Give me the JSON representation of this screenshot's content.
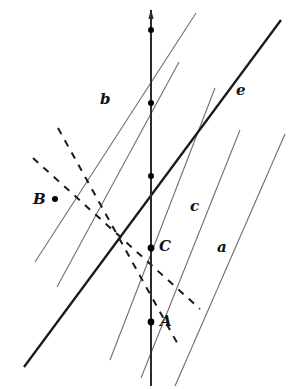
{
  "figure": {
    "width": 295,
    "height": 389,
    "background": "#ffffff"
  },
  "colors": {
    "thin_line": "#6e6e76",
    "thick_line": "#1a1a1a",
    "vertical_line": "#2b2b2b",
    "dashed_line": "#1a1a1a",
    "point_fill": "#000000",
    "label_text": "#111111"
  },
  "labels": {
    "line_a": "a",
    "line_b": "b",
    "line_c": "c",
    "line_e": "e",
    "point_A": "A",
    "point_B": "B",
    "point_C": "C"
  },
  "label_positions": {
    "line_a": {
      "x": 217,
      "y": 240
    },
    "line_b": {
      "x": 100,
      "y": 92
    },
    "line_c": {
      "x": 190,
      "y": 199
    },
    "line_e": {
      "x": 236,
      "y": 83
    },
    "point_A": {
      "x": 160,
      "y": 314
    },
    "point_B": {
      "x": 33,
      "y": 192
    },
    "point_C": {
      "x": 159,
      "y": 239
    }
  },
  "geometry": {
    "vertical_line": {
      "name": "vertical-transversal",
      "x1": 151,
      "y1": 10,
      "x2": 151,
      "y2": 386,
      "stroke": "#2b2b2b",
      "width": 2.0,
      "arrow_top": true
    },
    "thin_parallels": [
      {
        "name": "parallel-line-1",
        "x1": 35,
        "y1": 262,
        "x2": 196,
        "y2": 13,
        "stroke": "#6e6e76",
        "width": 1.1
      },
      {
        "name": "parallel-line-b",
        "x1": 57,
        "y1": 287,
        "x2": 179,
        "y2": 62,
        "stroke": "#6e6e76",
        "width": 1.1
      },
      {
        "name": "parallel-line-3",
        "x1": 110,
        "y1": 360,
        "x2": 215,
        "y2": 88,
        "stroke": "#6e6e76",
        "width": 1.1
      },
      {
        "name": "parallel-line-c",
        "x1": 141,
        "y1": 378,
        "x2": 240,
        "y2": 130,
        "stroke": "#6e6e76",
        "width": 1.1
      },
      {
        "name": "parallel-line-a",
        "x1": 175,
        "y1": 386,
        "x2": 285,
        "y2": 134,
        "stroke": "#6e6e76",
        "width": 1.1
      }
    ],
    "thick_line_e": {
      "name": "line-e",
      "x1": 24,
      "y1": 367,
      "x2": 281,
      "y2": 20,
      "stroke": "#1a1a1a",
      "width": 2.3
    },
    "dashed_lines": [
      {
        "name": "dashed-line-1",
        "x1": 33,
        "y1": 158,
        "x2": 200,
        "y2": 309,
        "stroke": "#1a1a1a",
        "width": 2.0,
        "dash": "7 7"
      },
      {
        "name": "dashed-line-2",
        "x1": 58,
        "y1": 128,
        "x2": 180,
        "y2": 348,
        "stroke": "#1a1a1a",
        "width": 2.0,
        "dash": "7 7"
      }
    ],
    "points": [
      {
        "name": "point-dot-top",
        "x": 151,
        "y": 30,
        "r": 3.0,
        "labeled": false
      },
      {
        "name": "point-dot-second",
        "x": 151,
        "y": 103,
        "r": 3.0,
        "labeled": false
      },
      {
        "name": "point-dot-third",
        "x": 151,
        "y": 176,
        "r": 3.0,
        "labeled": false
      },
      {
        "name": "point-C",
        "x": 151,
        "y": 248,
        "r": 3.4,
        "labeled": true
      },
      {
        "name": "point-A",
        "x": 151,
        "y": 322,
        "r": 3.4,
        "labeled": true
      },
      {
        "name": "point-B",
        "x": 55,
        "y": 199,
        "r": 3.0,
        "labeled": true
      }
    ]
  },
  "chart_data": {
    "type": "scatter",
    "xlabel": "",
    "ylabel": "",
    "named_lines": [
      "a",
      "b",
      "c",
      "e"
    ],
    "named_points": [
      "A",
      "B",
      "C"
    ],
    "point_coordinates": {
      "A": [
        151,
        322
      ],
      "B": [
        55,
        199
      ],
      "C": [
        151,
        248
      ]
    }
  }
}
